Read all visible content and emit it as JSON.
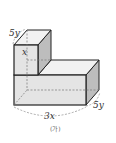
{
  "figure": {
    "labels": {
      "cube_depth": "5y",
      "cube_width": "x",
      "box_depth": "5y",
      "box_width": "3x",
      "caption": "(가)"
    },
    "colors": {
      "front_face": "#e4e4e4",
      "top_face": "#f2f2f2",
      "side_face": "#bdbdbd",
      "edge": "#222222",
      "hidden_edge": "#777777"
    }
  }
}
